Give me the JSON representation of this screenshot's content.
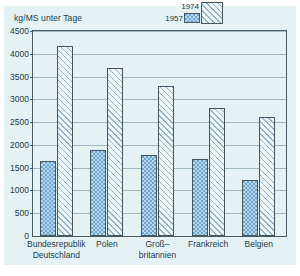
{
  "chart_data": {
    "type": "bar",
    "title": "",
    "ylabel": "kg/MS unter Tage",
    "xlabel": "",
    "ylim": [
      0,
      4500
    ],
    "yticks": [
      0,
      500,
      1000,
      1500,
      2000,
      2500,
      3000,
      3500,
      4000,
      4500
    ],
    "ytick_labels": [
      "0",
      "500",
      "1000",
      "1500",
      "2000",
      "2500",
      "3000",
      "3500",
      "4000",
      "4500"
    ],
    "grid": true,
    "legend_position": "top-right",
    "categories": [
      "Bundesrepublik\nDeutschland",
      "Polen",
      "Groß–\nbritannien",
      "Frankreich",
      "Belgien"
    ],
    "category_lines": [
      [
        "Bundesrepublik",
        "Deutschland"
      ],
      [
        "Polen"
      ],
      [
        "Groß–",
        "britannien"
      ],
      [
        "Frankreich"
      ],
      [
        "Belgien"
      ]
    ],
    "series": [
      {
        "name": "1957",
        "pattern": "blue-checker",
        "color": "#6ba6d0",
        "values": [
          1650,
          1880,
          1780,
          1690,
          1220
        ]
      },
      {
        "name": "1974",
        "pattern": "diagonal-hatch",
        "color": "#eef6f7",
        "values": [
          4180,
          3690,
          3300,
          2810,
          2610
        ]
      }
    ]
  },
  "colors": {
    "paper_background": "#e4f2f4",
    "axis": "#4a5a62",
    "gridline": "#9fb9c2",
    "text": "#1b3b4a",
    "bar_1957": "#6ba6d0",
    "bar_1974": "#eef6f7"
  }
}
